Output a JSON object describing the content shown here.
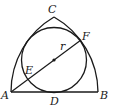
{
  "diagram": {
    "type": "geometry",
    "points": {
      "A": "A",
      "B": "B",
      "C": "C",
      "D": "D",
      "E": "E",
      "F": "F"
    },
    "radius_label": "r",
    "colors": {
      "stroke": "#1a1a1a",
      "background": "#ffffff"
    }
  }
}
